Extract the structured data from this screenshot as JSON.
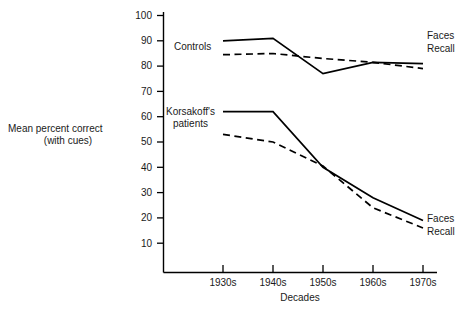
{
  "chart_data": {
    "type": "line",
    "title": "",
    "xlabel": "Decades",
    "ylabel": "Mean percent correct (with cues)",
    "ylabel_line1": "Mean percent correct",
    "ylabel_line2": "(with cues)",
    "categories": [
      "1930s",
      "1940s",
      "1950s",
      "1960s",
      "1970s"
    ],
    "ylim": [
      0,
      100
    ],
    "yticks": [
      10,
      20,
      30,
      40,
      50,
      60,
      70,
      80,
      90,
      100
    ],
    "grid": false,
    "legend_position": "inline-right",
    "group_annotations": [
      {
        "name": "controls-group-label",
        "text": "Controls",
        "line1": "Controls",
        "line2": ""
      },
      {
        "name": "korsakoff-group-label",
        "text": "Korsakoff's patients",
        "line1": "Korsakoff's",
        "line2": "patients"
      }
    ],
    "series": [
      {
        "name": "Faces",
        "group": "Controls",
        "style": "solid",
        "label": "Faces",
        "values": [
          90,
          91,
          77,
          81.5,
          81
        ]
      },
      {
        "name": "Recall",
        "group": "Controls",
        "style": "dashed",
        "label": "Recall",
        "values": [
          84.5,
          85,
          83,
          81.5,
          79
        ]
      },
      {
        "name": "Faces",
        "group": "Korsakoff's patients",
        "style": "solid",
        "label": "Faces",
        "values": [
          62,
          62,
          40,
          28,
          19
        ]
      },
      {
        "name": "Recall",
        "group": "Korsakoff's patients",
        "style": "dashed",
        "label": "Recall",
        "values": [
          53,
          50,
          40.5,
          24,
          16
        ]
      }
    ]
  },
  "axes": {
    "y_tick_labels": [
      "100",
      "90",
      "80",
      "70",
      "60",
      "50",
      "40",
      "30",
      "20",
      "10"
    ],
    "x_tick_labels": [
      "1930s",
      "1940s",
      "1950s",
      "1960s",
      "1970s"
    ],
    "x_axis_title": "Decades",
    "y_axis_title_line1": "Mean percent correct",
    "y_axis_title_line2": "(with cues)"
  },
  "annotations": {
    "controls": "Controls",
    "korsakoff_line1": "Korsakoff's",
    "korsakoff_line2": "patients",
    "controls_faces": "Faces",
    "controls_recall": "Recall",
    "korsakoff_faces": "Faces",
    "korsakoff_recall": "Recall"
  },
  "colors": {
    "line": "#000000",
    "axis": "#000000",
    "text": "#1a1a1a",
    "background": "#ffffff"
  }
}
